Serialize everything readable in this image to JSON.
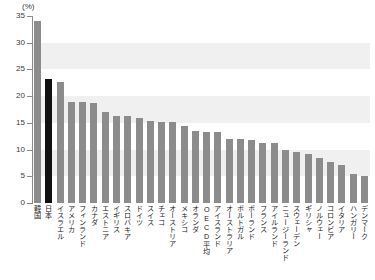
{
  "chart_data": {
    "type": "bar",
    "title": "",
    "subtitle": "",
    "xlabel": "",
    "ylabel": "",
    "unit_label": "(%)",
    "ylim": [
      0,
      35
    ],
    "yticks": [
      0,
      5,
      10,
      15,
      20,
      25,
      30,
      35
    ],
    "ytick_labels": [
      "0",
      "5",
      "10",
      "15",
      "20",
      "25",
      "30",
      "35"
    ],
    "grid": "horizontal-bands",
    "legend": "none",
    "highlight_category": "日本",
    "series_color": "#8c8c8c",
    "highlight_color": "#111111",
    "categories": [
      "韓国",
      "日本",
      "イスラエル",
      "アメリカ",
      "フィンランド",
      "カナダ",
      "エストニア",
      "イギリス",
      "スロバキア",
      "ドイツ",
      "スイス",
      "チェコ",
      "オーストリア",
      "メキシコ",
      "オランダ",
      "OECD平均",
      "アイスランド",
      "オーストラリア",
      "ポルトガル",
      "ポーランド",
      "フランス",
      "アイルランド",
      "ニュージーランド",
      "スウェーデン",
      "ギリシャ",
      "ノルウェー",
      "コロンビア",
      "イタリア",
      "ハンガリー",
      "デンマーク"
    ],
    "values": [
      34.0,
      23.3,
      22.7,
      19.0,
      19.0,
      18.7,
      17.0,
      16.3,
      16.2,
      15.9,
      15.3,
      15.2,
      15.1,
      14.4,
      13.5,
      13.3,
      13.2,
      12.0,
      11.9,
      11.8,
      11.3,
      11.3,
      9.9,
      9.5,
      9.2,
      8.4,
      7.6,
      7.1,
      5.5,
      5.0
    ]
  }
}
